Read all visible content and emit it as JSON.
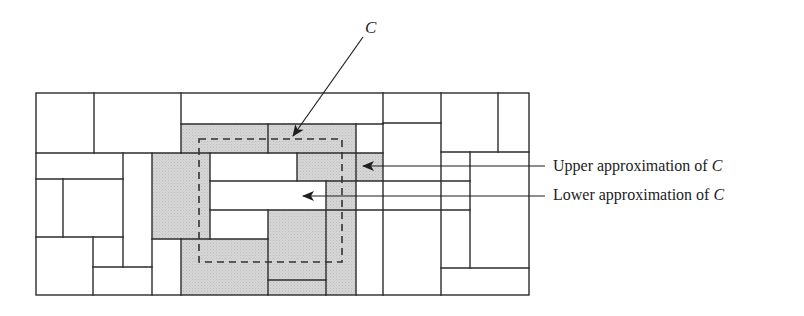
{
  "diagram": {
    "type": "rough-set-approximation",
    "colors": {
      "stroke": "#2b2b2b",
      "shaded": "#d4d4d4",
      "background": "#ffffff",
      "dashed_set": "#333333"
    },
    "set_label": "C",
    "labels": {
      "upper": "Upper approximation of ",
      "lower": "Lower approximation of ",
      "set_name": "C"
    },
    "grid_bounds": {
      "x": 36,
      "y": 93,
      "width": 493,
      "height": 202
    },
    "shaded_cells": [
      {
        "x": 181,
        "y": 124,
        "w": 175,
        "h": 29
      },
      {
        "x": 152,
        "y": 153,
        "w": 58,
        "h": 86
      },
      {
        "x": 297,
        "y": 153,
        "w": 86,
        "h": 28
      },
      {
        "x": 326,
        "y": 181,
        "w": 30,
        "h": 114
      },
      {
        "x": 268,
        "y": 210,
        "w": 58,
        "h": 85
      },
      {
        "x": 181,
        "y": 239,
        "w": 87,
        "h": 56
      }
    ],
    "dashed_region": {
      "x": 199,
      "y": 139,
      "w": 143,
      "h": 123
    }
  }
}
